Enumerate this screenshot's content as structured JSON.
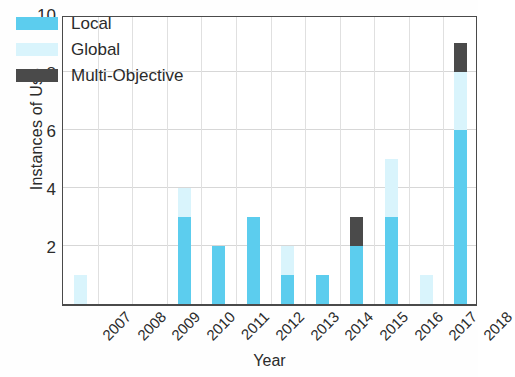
{
  "chart_data": {
    "type": "bar",
    "title": "",
    "subtitle": "",
    "xlabel": "Year",
    "ylabel": "Instances of Use",
    "categories": [
      "2007",
      "2008",
      "2009",
      "2010",
      "2011",
      "2012",
      "2013",
      "2014",
      "2015",
      "2016",
      "2017",
      "2018"
    ],
    "stacked": true,
    "series": [
      {
        "name": "Local",
        "color": "#5ccdee",
        "values": [
          0,
          0,
          0,
          3,
          2,
          3,
          1,
          1,
          2,
          3,
          0,
          6
        ]
      },
      {
        "name": "Global",
        "color": "#d9f4fc",
        "values": [
          1,
          0,
          0,
          1,
          0,
          0,
          1,
          0,
          0,
          2,
          1,
          2
        ]
      },
      {
        "name": "Multi-Objective",
        "color": "#4a4a4a",
        "values": [
          0,
          0,
          0,
          0,
          0,
          0,
          0,
          0,
          1,
          0,
          0,
          1
        ]
      }
    ],
    "totals": [
      1,
      0,
      0,
      4,
      2,
      3,
      2,
      1,
      3,
      5,
      1,
      9
    ],
    "ylim": [
      0,
      10
    ],
    "yticks": [
      0,
      2,
      4,
      6,
      8,
      10
    ],
    "ytick_labels": [
      "",
      "2",
      "4",
      "6",
      "8",
      "10"
    ],
    "grid": true,
    "legend_position": "top-left"
  },
  "legend": {
    "entries": [
      {
        "label": "Local",
        "color": "#5ccdee"
      },
      {
        "label": "Global",
        "color": "#d9f4fc"
      },
      {
        "label": "Multi-Objective",
        "color": "#4a4a4a"
      }
    ]
  },
  "axes": {
    "y_title": "Instances of Use",
    "x_title": "Year"
  }
}
